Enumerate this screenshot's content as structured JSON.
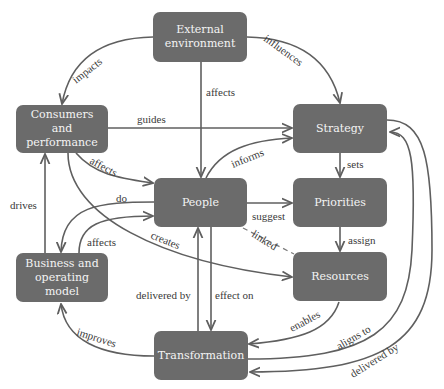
{
  "nodes": {
    "external": {
      "label": "External environment",
      "line1": "External",
      "line2": "environment"
    },
    "consumers": {
      "label": "Consumers and performance",
      "line1": "Consumers and",
      "line2": "performance"
    },
    "strategy": {
      "label": "Strategy"
    },
    "people": {
      "label": "People"
    },
    "priorities": {
      "label": "Priorities"
    },
    "business": {
      "label": "Business and operating model",
      "line1": "Business and",
      "line2": "operating model"
    },
    "resources": {
      "label": "Resources"
    },
    "transformation": {
      "label": "Transformation"
    }
  },
  "edges": {
    "impacts": "impacts",
    "influences": "influences",
    "affects_ext": "affects",
    "guides": "guides",
    "informs": "informs",
    "sets": "sets",
    "affects_cons": "affects",
    "drives": "drives",
    "do": "do",
    "affects_bus": "affects",
    "creates": "creates",
    "suggest": "suggest",
    "linked": "linked",
    "assign": "assign",
    "delivered_by_people": "delivered by",
    "effect_on": "effect on",
    "improves": "improves",
    "enables": "enables",
    "aligns_to": "aligns to",
    "delivered_by_strategy": "delivered by"
  },
  "colors": {
    "node_fill": "#6b6b6b",
    "node_text": "#f4f4f4",
    "edge": "#5f5f5f",
    "label": "#3a3a3a"
  }
}
